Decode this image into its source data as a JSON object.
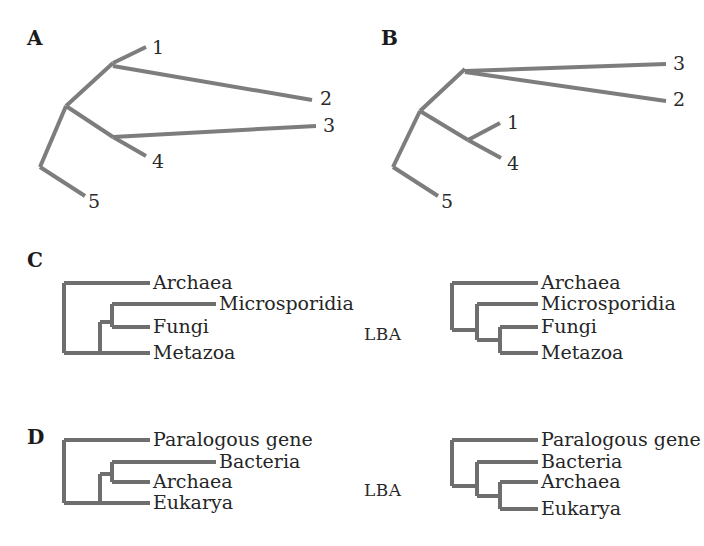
{
  "figure": {
    "background": "#ffffff",
    "branch_color": "#7d7d7d",
    "clado_color": "#6e6e6e",
    "arrow_color": "#9a9a9a",
    "text_color": "#262626"
  },
  "panels": {
    "a": {
      "letter": "A",
      "type": "unrooted-phylogram",
      "tips": [
        {
          "id": "1",
          "label": "1"
        },
        {
          "id": "2",
          "label": "2"
        },
        {
          "id": "3",
          "label": "3"
        },
        {
          "id": "4",
          "label": "4"
        },
        {
          "id": "5",
          "label": "5"
        }
      ]
    },
    "b": {
      "letter": "B",
      "type": "unrooted-phylogram",
      "tips": [
        {
          "id": "3",
          "label": "3"
        },
        {
          "id": "2",
          "label": "2"
        },
        {
          "id": "1",
          "label": "1"
        },
        {
          "id": "4",
          "label": "4"
        }
      ],
      "tip5": {
        "id": "5",
        "label": "5"
      }
    },
    "c": {
      "letter": "C",
      "type": "cladogram-pair",
      "transition_label": "LBA",
      "left_taxa": [
        {
          "name": "Archaea"
        },
        {
          "name": "Microsporidia"
        },
        {
          "name": "Fungi"
        },
        {
          "name": "Metazoa"
        }
      ],
      "right_taxa": [
        {
          "name": "Archaea"
        },
        {
          "name": "Microsporidia"
        },
        {
          "name": "Fungi"
        },
        {
          "name": "Metazoa"
        }
      ]
    },
    "d": {
      "letter": "D",
      "type": "cladogram-pair",
      "transition_label": "LBA",
      "left_taxa": [
        {
          "name": "Paralogous gene"
        },
        {
          "name": "Bacteria"
        },
        {
          "name": "Archaea"
        },
        {
          "name": "Eukarya"
        }
      ],
      "right_taxa": [
        {
          "name": "Paralogous gene"
        },
        {
          "name": "Bacteria"
        },
        {
          "name": "Archaea"
        },
        {
          "name": "Eukarya"
        }
      ]
    }
  }
}
